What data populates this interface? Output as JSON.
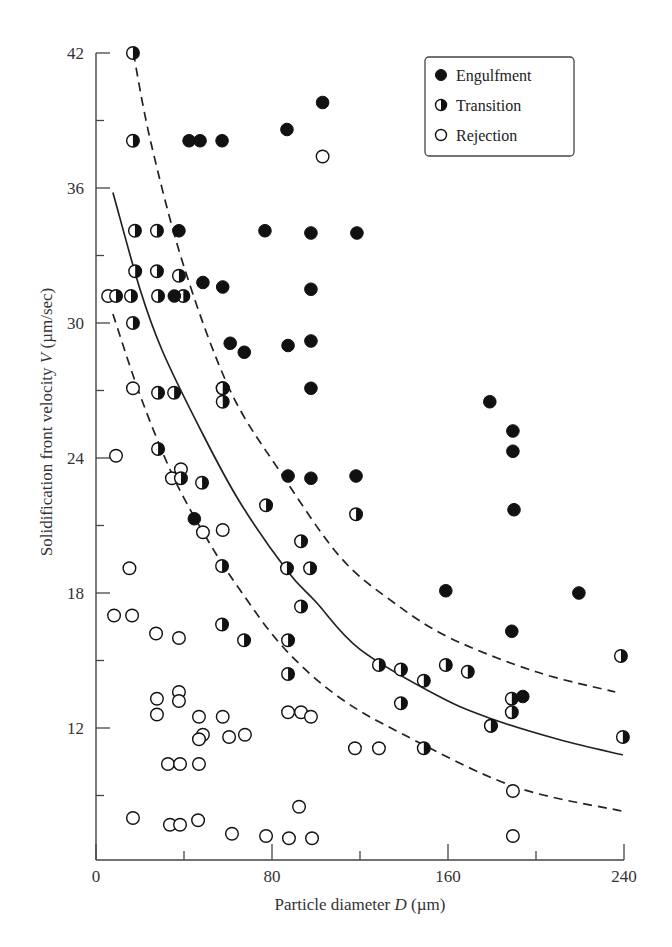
{
  "chart_data": {
    "type": "scatter",
    "title": "",
    "xlabel": "Particle diameter D (µm)",
    "xlabel_parts": {
      "prefix": "Particle diameter ",
      "var": "D",
      "suffix": " (µm)"
    },
    "ylabel": "Solidification front velocity V (µm/sec)",
    "ylabel_parts": {
      "prefix": "Solidification front velocity ",
      "var": "V",
      "suffix": " (µm/sec)"
    },
    "xlim": [
      0,
      240
    ],
    "ylim": [
      6.1,
      42
    ],
    "x_ticks": [
      0,
      80,
      160,
      240
    ],
    "x_minor_ticks": [
      40,
      120,
      200
    ],
    "y_ticks": [
      12,
      18,
      24,
      30,
      36,
      42
    ],
    "y_minor_ticks": [
      9,
      15,
      21,
      27,
      33,
      39
    ],
    "grid": false,
    "legend_position": "upper right",
    "legend": [
      {
        "name": "Engulfment",
        "marker": "filled-circle"
      },
      {
        "name": "Transition",
        "marker": "half-filled-circle"
      },
      {
        "name": "Rejection",
        "marker": "open-circle"
      }
    ],
    "series": [
      {
        "name": "Engulfment",
        "marker": "filled-circle",
        "points": [
          [
            42.3,
            38.1
          ],
          [
            47.3,
            38.1
          ],
          [
            57.3,
            38.1
          ],
          [
            86.8,
            38.6
          ],
          [
            103,
            39.8
          ],
          [
            37.7,
            34.1
          ],
          [
            76.8,
            34.1
          ],
          [
            97.7,
            34.0
          ],
          [
            118.6,
            34.0
          ],
          [
            48.6,
            31.8
          ],
          [
            57.6,
            31.6
          ],
          [
            35.6,
            31.2
          ],
          [
            97.7,
            31.5
          ],
          [
            61,
            29.1
          ],
          [
            67.4,
            28.7
          ],
          [
            87.3,
            29.0
          ],
          [
            97.7,
            29.2
          ],
          [
            97.7,
            27.1
          ],
          [
            87.3,
            23.2
          ],
          [
            97.7,
            23.1
          ],
          [
            118.2,
            23.2
          ],
          [
            44.7,
            21.3
          ],
          [
            179,
            26.5
          ],
          [
            189.5,
            25.2
          ],
          [
            189.5,
            24.3
          ],
          [
            190,
            21.7
          ],
          [
            159,
            18.1
          ],
          [
            219.5,
            18.0
          ],
          [
            189,
            16.3
          ],
          [
            194,
            13.4
          ]
        ]
      },
      {
        "name": "Transition",
        "marker": "half-filled-circle",
        "points": [
          [
            16.8,
            42
          ],
          [
            16.8,
            38.1
          ],
          [
            17.7,
            34.1
          ],
          [
            27.7,
            34.1
          ],
          [
            17.8,
            32.3
          ],
          [
            27.7,
            32.3
          ],
          [
            37.7,
            32.1
          ],
          [
            9.1,
            31.2
          ],
          [
            15.9,
            31.2
          ],
          [
            28.2,
            31.2
          ],
          [
            39.7,
            31.2
          ],
          [
            16.8,
            30.0
          ],
          [
            28.2,
            26.9
          ],
          [
            35.5,
            26.9
          ],
          [
            57.6,
            27.1
          ],
          [
            57.6,
            26.5
          ],
          [
            28.2,
            24.4
          ],
          [
            38.6,
            23.1
          ],
          [
            48.2,
            22.9
          ],
          [
            77.3,
            21.9
          ],
          [
            118.2,
            21.5
          ],
          [
            93.2,
            20.3
          ],
          [
            57.3,
            19.2
          ],
          [
            86.8,
            19.1
          ],
          [
            97.3,
            19.1
          ],
          [
            93.2,
            17.4
          ],
          [
            57.3,
            16.6
          ],
          [
            67.3,
            15.9
          ],
          [
            87.3,
            15.9
          ],
          [
            87.3,
            14.4
          ],
          [
            128.6,
            14.8
          ],
          [
            138.6,
            14.6
          ],
          [
            149,
            14.1
          ],
          [
            159,
            14.8
          ],
          [
            169,
            14.5
          ],
          [
            138.6,
            13.1
          ],
          [
            189,
            13.3
          ],
          [
            189,
            12.7
          ],
          [
            179.5,
            12.1
          ],
          [
            238.6,
            15.2
          ],
          [
            239.5,
            11.6
          ],
          [
            149,
            11.1
          ]
        ]
      },
      {
        "name": "Rejection",
        "marker": "open-circle",
        "points": [
          [
            103,
            37.4
          ],
          [
            5.5,
            31.2
          ],
          [
            16.8,
            27.1
          ],
          [
            57.6,
            27.1
          ],
          [
            9.1,
            24.1
          ],
          [
            38.6,
            23.5
          ],
          [
            34.5,
            23.1
          ],
          [
            48.6,
            20.7
          ],
          [
            57.6,
            20.8
          ],
          [
            15.2,
            19.1
          ],
          [
            8.2,
            17.0
          ],
          [
            16.4,
            17.0
          ],
          [
            27.3,
            16.2
          ],
          [
            37.7,
            16.0
          ],
          [
            27.7,
            13.3
          ],
          [
            27.7,
            12.6
          ],
          [
            37.7,
            13.6
          ],
          [
            37.7,
            13.2
          ],
          [
            46.8,
            12.5
          ],
          [
            57.6,
            12.5
          ],
          [
            87.3,
            12.7
          ],
          [
            93.2,
            12.7
          ],
          [
            97.7,
            12.5
          ],
          [
            48.6,
            11.7
          ],
          [
            46.8,
            11.5
          ],
          [
            60.5,
            11.6
          ],
          [
            67.7,
            11.7
          ],
          [
            117.7,
            11.1
          ],
          [
            128.6,
            11.1
          ],
          [
            179.5,
            12.1
          ],
          [
            32.7,
            10.4
          ],
          [
            38.2,
            10.4
          ],
          [
            46.8,
            10.4
          ],
          [
            16.8,
            8.0
          ],
          [
            33.6,
            7.7
          ],
          [
            38.2,
            7.7
          ],
          [
            46.4,
            7.9
          ],
          [
            92.3,
            8.5
          ],
          [
            61.8,
            7.3
          ],
          [
            77.3,
            7.2
          ],
          [
            87.7,
            7.1
          ],
          [
            98.2,
            7.1
          ],
          [
            189.5,
            9.2
          ],
          [
            189.5,
            7.2
          ]
        ]
      }
    ],
    "curves": [
      {
        "name": "fit",
        "style": "solid",
        "points": [
          [
            7.7,
            35.8
          ],
          [
            20,
            31.5
          ],
          [
            30,
            28.8
          ],
          [
            47.3,
            25.3
          ],
          [
            65,
            22.1
          ],
          [
            86.8,
            19.0
          ],
          [
            100,
            17.6
          ],
          [
            120,
            15.5
          ],
          [
            156,
            13.4
          ],
          [
            180,
            12.4
          ],
          [
            210,
            11.5
          ],
          [
            239.5,
            10.8
          ]
        ]
      },
      {
        "name": "upper-bound",
        "style": "dashed",
        "points": [
          [
            17,
            42
          ],
          [
            25,
            38
          ],
          [
            40,
            32.5
          ],
          [
            61,
            27.0
          ],
          [
            85,
            23.2
          ],
          [
            111,
            19.6
          ],
          [
            135,
            17.6
          ],
          [
            161,
            16.0
          ],
          [
            200,
            14.5
          ],
          [
            236,
            13.6
          ]
        ]
      },
      {
        "name": "lower-bound",
        "style": "dashed",
        "points": [
          [
            7.7,
            30.4
          ],
          [
            20,
            26.8
          ],
          [
            35,
            23.2
          ],
          [
            50.5,
            20.4
          ],
          [
            65,
            18.2
          ],
          [
            85,
            15.6
          ],
          [
            110,
            13.4
          ],
          [
            140,
            11.7
          ],
          [
            190,
            9.4
          ],
          [
            239.5,
            8.3
          ]
        ]
      }
    ]
  },
  "colors": {
    "axis": "#444444",
    "marker": "#111111",
    "background": "#ffffff"
  }
}
